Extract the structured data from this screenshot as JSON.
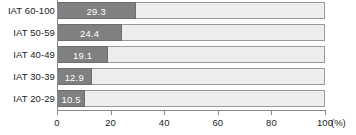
{
  "chart_data": {
    "type": "bar",
    "orientation": "horizontal",
    "title": "",
    "xlabel": "(%)",
    "ylabel": "",
    "categories": [
      "IAT 60-100",
      "IAT 50-59",
      "IAT 40-49",
      "IAT 30-39",
      "IAT 20-29"
    ],
    "values": [
      29.3,
      24.4,
      19.1,
      12.9,
      10.5
    ],
    "value_labels": [
      "29.3",
      "24.4",
      "19.1",
      "12.9",
      "10.5"
    ],
    "xlim": [
      0,
      100
    ],
    "xticks": [
      0,
      20,
      40,
      60,
      80,
      100
    ],
    "xtick_labels": [
      "0",
      "20",
      "40",
      "60",
      "80",
      "100"
    ],
    "unit_label": "(%)",
    "grid": false,
    "legend": false,
    "series": [
      {
        "name": "percentage",
        "values": [
          29.3,
          24.4,
          19.1,
          12.9,
          10.5
        ]
      }
    ],
    "colors": {
      "bar_fill": "#808080",
      "bar_fill_border": "#6d6d6d",
      "bar_track": "#ededed",
      "bar_track_border": "#9a9a9a",
      "axis": "#8a8a8a",
      "text": "#1c1c1c",
      "value_text": "#ffffff",
      "background": "#ffffff"
    }
  }
}
